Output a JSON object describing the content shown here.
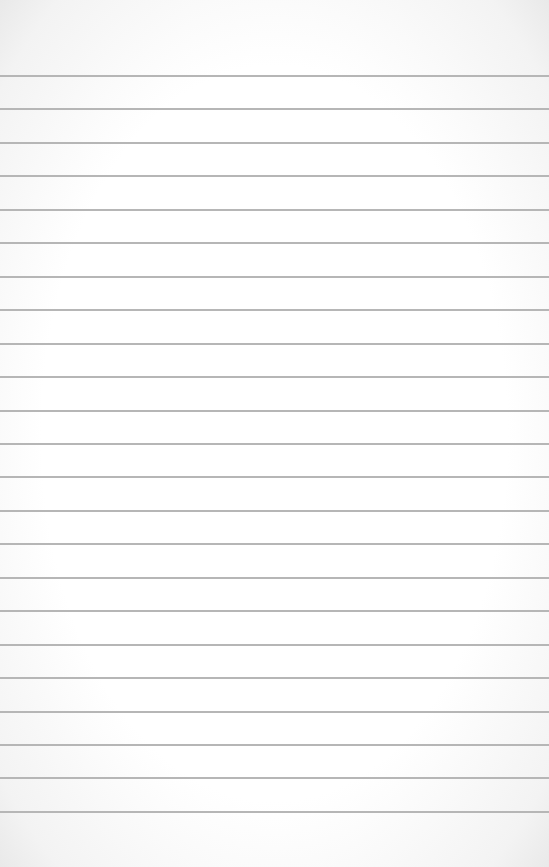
{
  "paper": {
    "type": "lined-paper",
    "background_color": "#ffffff",
    "line_color": "#b6b6b6",
    "line_count": 23,
    "first_line_y": 76,
    "line_spacing": 33.45,
    "line_thickness": 2,
    "text": ""
  }
}
